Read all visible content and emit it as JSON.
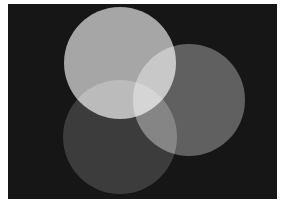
{
  "diagram": {
    "type": "venn",
    "background": {
      "x": 8,
      "y": 4,
      "width": 269,
      "height": 195,
      "color": "#161616"
    },
    "frame_color": "#ffffff",
    "circles": [
      {
        "id": "top",
        "cx": 120,
        "cy": 63,
        "r": 56,
        "color": "#a6a6a6"
      },
      {
        "id": "right",
        "cx": 189,
        "cy": 100,
        "r": 56,
        "color": "#606060"
      },
      {
        "id": "bottom-left",
        "cx": 120,
        "cy": 137,
        "r": 57,
        "color": "#3c3c3c"
      }
    ]
  }
}
